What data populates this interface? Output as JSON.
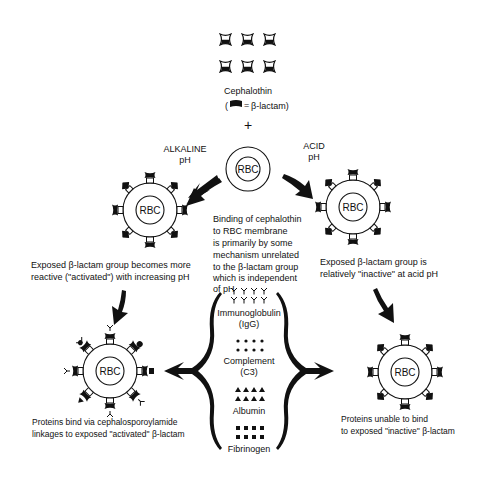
{
  "diagram": {
    "top": {
      "drug_name": "Cephalothin",
      "legend_open": "(",
      "legend_equals": "=",
      "legend_text": "β-lactam)",
      "plus": "+"
    },
    "center_rbc": {
      "label": "RBC",
      "caption_lines": [
        "Binding of cephalothin",
        "to  RBC membrane",
        "is  primarily by some",
        "mechanism  unrelated",
        "to the  β-lactam group",
        "which is independent",
        "of  pH"
      ]
    },
    "alkaline": {
      "condition_lines": [
        "ALKALINE",
        "pH"
      ],
      "rbc_label": "RBC",
      "caption_lines": [
        "Exposed  β-lactam group becomes more",
        "reactive (\"activated\") with increasing pH"
      ]
    },
    "acid": {
      "condition_lines": [
        "ACID",
        "pH"
      ],
      "rbc_label": "RBC",
      "caption_lines": [
        "Exposed  β-lactam group is",
        "relatively  \"inactive\"  at acid pH"
      ]
    },
    "proteins": [
      {
        "name": "Immunoglobulin",
        "abbr": "(IgG)",
        "symbol": "y-shape"
      },
      {
        "name": "Complement",
        "abbr": "(C3)",
        "symbol": "dot"
      },
      {
        "name": "Albumin",
        "abbr": "",
        "symbol": "triangle"
      },
      {
        "name": "Fibrinogen",
        "abbr": "",
        "symbol": "square"
      }
    ],
    "result_bound": {
      "rbc_label": "RBC",
      "caption_lines": [
        "Proteins  bind  via  cephalosporoylamide",
        "linkages to exposed \"activated\"  β-lactam"
      ]
    },
    "result_unbound": {
      "rbc_label": "RBC",
      "caption_lines": [
        "Proteins  unable to  bind",
        "to exposed  \"inactive\"  β-lactam"
      ]
    },
    "colors": {
      "ink": "#111111",
      "background": "#ffffff"
    }
  }
}
